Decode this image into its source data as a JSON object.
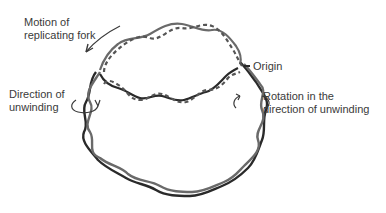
{
  "diagram": {
    "type": "dna-replication-theta-structure",
    "labels": {
      "fork_motion_line1": "Motion of",
      "fork_motion_line2": "replicating fork",
      "unwinding_line1": "Direction of",
      "unwinding_line2": "unwinding",
      "origin": "Origin",
      "rotation_line1": "Rotation in the",
      "rotation_line2": "direction of unwinding"
    },
    "colors": {
      "parental_strand": "#2a2a2a",
      "parental_strand_light": "#6a6a6a",
      "new_strand_dashed": "#555555",
      "text": "#3a3a3a",
      "background": "#ffffff"
    }
  }
}
